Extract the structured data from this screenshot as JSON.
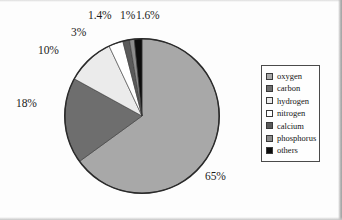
{
  "chart_data": {
    "type": "pie",
    "title": "",
    "xlabel": "",
    "ylabel": "",
    "legend_position": "right",
    "grid": false,
    "categories": [
      "oxygen",
      "carbon",
      "hydrogen",
      "nitrogen",
      "calcium",
      "phosphorus",
      "others"
    ],
    "values": [
      65,
      18,
      10,
      3,
      1.4,
      1,
      1.6
    ],
    "value_labels": [
      "65%",
      "18%",
      "10%",
      "3%",
      "1.4%",
      "1%",
      "1.6%"
    ],
    "colors": [
      "#a8a8a8",
      "#6e6e6e",
      "#ebebeb",
      "#ffffff",
      "#5a5a5a",
      "#8c8c8c",
      "#0d0d0d"
    ],
    "slice_order": "clockwise from 12 o'clock: oxygen, then counterclockwise others, phosphorus, calcium, nitrogen, hydrogen, carbon",
    "slices": [
      {
        "name": "oxygen",
        "value": 65,
        "label": "65%",
        "color": "#a8a8a8"
      },
      {
        "name": "carbon",
        "value": 18,
        "label": "18%",
        "color": "#6e6e6e"
      },
      {
        "name": "hydrogen",
        "value": 10,
        "label": "10%",
        "color": "#ebebeb"
      },
      {
        "name": "nitrogen",
        "value": 3,
        "label": "3%",
        "color": "#ffffff"
      },
      {
        "name": "calcium",
        "value": 1.4,
        "label": "1.4%",
        "color": "#5a5a5a"
      },
      {
        "name": "phosphorus",
        "value": 1,
        "label": "1%",
        "color": "#8c8c8c"
      },
      {
        "name": "others",
        "value": 1.6,
        "label": "1.6%",
        "color": "#0d0d0d"
      }
    ]
  },
  "legend": {
    "items": [
      {
        "label": "oxygen",
        "color": "#a8a8a8"
      },
      {
        "label": "carbon",
        "color": "#6e6e6e"
      },
      {
        "label": "hydrogen",
        "color": "#ebebeb"
      },
      {
        "label": "nitrogen",
        "color": "#ffffff"
      },
      {
        "label": "calcium",
        "color": "#5a5a5a"
      },
      {
        "label": "phosphorus",
        "color": "#8c8c8c"
      },
      {
        "label": "others",
        "color": "#0d0d0d"
      }
    ]
  },
  "callouts": [
    {
      "name": "label-65",
      "text": "65%",
      "left": 205,
      "top": 170
    },
    {
      "name": "label-18",
      "text": "18%",
      "left": 16,
      "top": 97
    },
    {
      "name": "label-10",
      "text": "10%",
      "left": 38,
      "top": 44
    },
    {
      "name": "label-3",
      "text": "3%",
      "left": 71,
      "top": 26
    },
    {
      "name": "label-1p4",
      "text": "1.4%",
      "left": 88,
      "top": 9
    },
    {
      "name": "label-1",
      "text": "1%",
      "left": 120,
      "top": 9
    },
    {
      "name": "label-1p6",
      "text": "1.6%",
      "left": 136,
      "top": 9
    }
  ]
}
